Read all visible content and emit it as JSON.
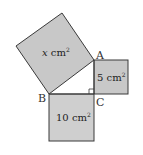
{
  "diagram": {
    "colors": {
      "fill": "#c8c8c8",
      "stroke": "#3a3a3a",
      "background": "#ffffff"
    },
    "vertices": {
      "A": {
        "label": "A"
      },
      "B": {
        "label": "B"
      },
      "C": {
        "label": "C"
      }
    },
    "squares": [
      {
        "id": "hypotenuse-square",
        "side": "AB",
        "area_label": "x cm",
        "var": "x",
        "unit": "cm",
        "exp": "2"
      },
      {
        "id": "leg-ac-square",
        "side": "AC",
        "area_label": "5 cm",
        "value": "5",
        "unit": "cm",
        "exp": "2"
      },
      {
        "id": "leg-bc-square",
        "side": "BC",
        "area_label": "10 cm",
        "value": "10",
        "unit": "cm",
        "exp": "2"
      }
    ],
    "right_angle_at": "C"
  }
}
